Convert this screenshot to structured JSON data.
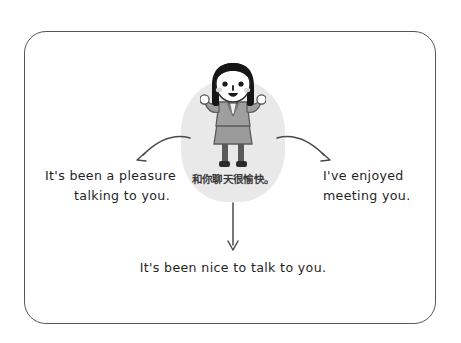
{
  "card": {
    "border_color": "#575757"
  },
  "center": {
    "blob_color": "#e9e9e9",
    "caption_cn": "和你聊天很愉快。",
    "character_alt": "smiling-businesswoman-illustration"
  },
  "branches": {
    "left": {
      "line1": "It's been a pleasure",
      "line2": "talking to you.",
      "arrow": "curved-arrow-down-left"
    },
    "right": {
      "line1": "I've enjoyed",
      "line2": "meeting you.",
      "arrow": "curved-arrow-down-right"
    },
    "bottom": {
      "line1": "It's been nice to talk to you.",
      "arrow": "straight-arrow-down"
    }
  },
  "colors": {
    "text": "#1f1f1f",
    "caption": "#3a3a3a",
    "arrow": "#4a4a4a",
    "hair": "#161616",
    "skin": "#ffffff",
    "suit": "#9b9b9b",
    "suit_dark": "#6f6f6f",
    "background": "#ffffff"
  }
}
